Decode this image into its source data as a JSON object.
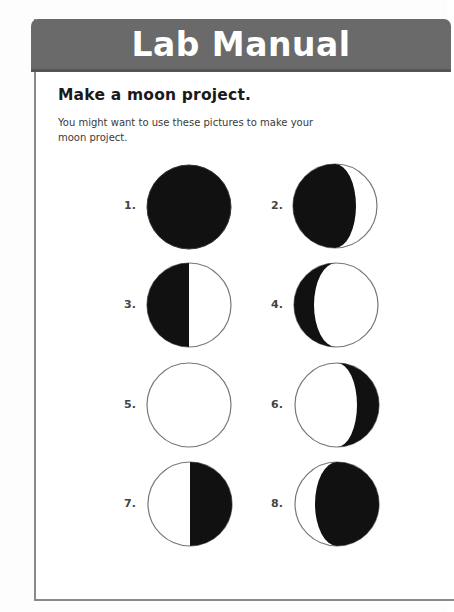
{
  "header": {
    "title": "Lab Manual"
  },
  "activity": {
    "heading": "Make a moon project.",
    "intro": "You might want to use these pictures to make your moon project."
  },
  "colors": {
    "header_bg": "#6a6a6a",
    "header_text": "#ffffff",
    "moon_dark": "#111111",
    "moon_light": "#ffffff",
    "outline": "#777777"
  },
  "moons": [
    {
      "number": "1.",
      "phase": "new-moon"
    },
    {
      "number": "2.",
      "phase": "waxing-crescent"
    },
    {
      "number": "3.",
      "phase": "first-quarter"
    },
    {
      "number": "4.",
      "phase": "waxing-gibbous"
    },
    {
      "number": "5.",
      "phase": "full-moon"
    },
    {
      "number": "6.",
      "phase": "waning-gibbous"
    },
    {
      "number": "7.",
      "phase": "last-quarter"
    },
    {
      "number": "8.",
      "phase": "waning-crescent"
    }
  ]
}
